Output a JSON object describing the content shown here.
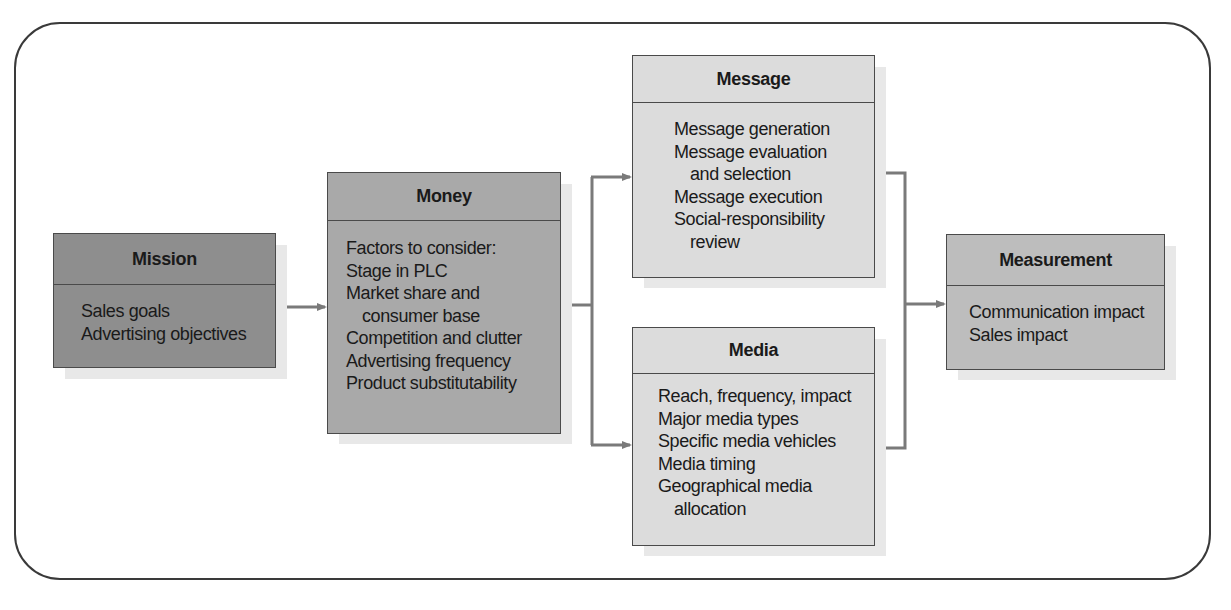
{
  "diagram": {
    "type": "flowchart",
    "colors": {
      "mission_fill": "#8e8e8e",
      "money_fill": "#a9a9a9",
      "message_fill": "#dcdcdc",
      "media_fill": "#dcdcdc",
      "measurement_fill": "#bdbdbd",
      "connector": "#7a7a7a",
      "border": "#4a4a4a"
    },
    "boxes": {
      "mission": {
        "title": "Mission",
        "lines": [
          {
            "text": "Sales goals",
            "indent": false
          },
          {
            "text": "Advertising objectives",
            "indent": false
          }
        ]
      },
      "money": {
        "title": "Money",
        "lines": [
          {
            "text": "Factors to consider:",
            "indent": false
          },
          {
            "text": "Stage in PLC",
            "indent": false
          },
          {
            "text": "Market share and",
            "indent": false
          },
          {
            "text": "consumer base",
            "indent": true
          },
          {
            "text": "Competition and clutter",
            "indent": false
          },
          {
            "text": "Advertising frequency",
            "indent": false
          },
          {
            "text": "Product substitutability",
            "indent": false
          }
        ]
      },
      "message": {
        "title": "Message",
        "lines": [
          {
            "text": "Message generation",
            "indent": false
          },
          {
            "text": "Message evaluation",
            "indent": false
          },
          {
            "text": "and selection",
            "indent": true
          },
          {
            "text": "Message execution",
            "indent": false
          },
          {
            "text": "Social-responsibility",
            "indent": false
          },
          {
            "text": "review",
            "indent": true
          }
        ]
      },
      "media": {
        "title": "Media",
        "lines": [
          {
            "text": "Reach, frequency, impact",
            "indent": false
          },
          {
            "text": "Major media types",
            "indent": false
          },
          {
            "text": "Specific media vehicles",
            "indent": false
          },
          {
            "text": "Media timing",
            "indent": false
          },
          {
            "text": "Geographical media",
            "indent": false
          },
          {
            "text": "allocation",
            "indent": true
          }
        ]
      },
      "measurement": {
        "title": "Measurement",
        "lines": [
          {
            "text": "Communication impact",
            "indent": false
          },
          {
            "text": "Sales impact",
            "indent": false
          }
        ]
      }
    },
    "edges": [
      {
        "from": "Mission",
        "to": "Money"
      },
      {
        "from": "Money",
        "to": "Message"
      },
      {
        "from": "Money",
        "to": "Media"
      },
      {
        "from": "Message",
        "to": "Measurement"
      },
      {
        "from": "Media",
        "to": "Measurement"
      }
    ]
  }
}
